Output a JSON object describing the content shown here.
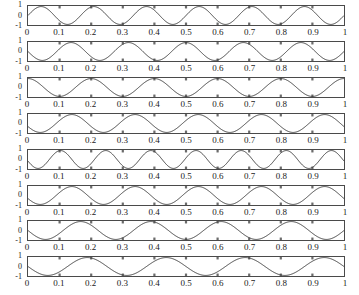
{
  "figure": {
    "background_color": "#ffffff",
    "axis_color": "#4a4a4a",
    "line_color": "#404040",
    "tick_color": "#6b6b6b",
    "width": 359,
    "height": 295,
    "subplot_count": 8
  },
  "axes": {
    "y_ticks": [
      "1",
      "0",
      "-1"
    ],
    "y_values": [
      1,
      0,
      -1
    ],
    "ylim": [
      -1,
      1
    ],
    "x_ticks": [
      "0",
      "0.1",
      "0.2",
      "0.3",
      "0.4",
      "0.5",
      "0.6",
      "0.7",
      "0.8",
      "0.9",
      "1"
    ],
    "x_values": [
      0,
      0.1,
      0.2,
      0.3,
      0.4,
      0.5,
      0.6,
      0.7,
      0.8,
      0.9,
      1
    ],
    "xlim": [
      0,
      1
    ]
  },
  "chart_data": {
    "type": "line",
    "title": "",
    "xlabel": "",
    "ylabel": "",
    "xlim": [
      0,
      1
    ],
    "ylim": [
      -1,
      1
    ],
    "grid": false,
    "legend": "none",
    "x_tick_labels": [
      "0",
      "0.1",
      "0.2",
      "0.3",
      "0.4",
      "0.5",
      "0.6",
      "0.7",
      "0.8",
      "0.9",
      "1"
    ],
    "y_tick_labels": [
      "1",
      "0",
      "-1"
    ],
    "panels": [
      {
        "index": 1,
        "label": "subplot-1",
        "form": "sine",
        "cycles": 6.0,
        "phase_deg": 0,
        "amplitude": 1
      },
      {
        "index": 2,
        "label": "subplot-2",
        "form": "sine",
        "cycles": 5.5,
        "phase_deg": 180,
        "amplitude": 1
      },
      {
        "index": 3,
        "label": "subplot-3",
        "form": "sine",
        "cycles": 5.0,
        "phase_deg": 90,
        "amplitude": 1
      },
      {
        "index": 4,
        "label": "subplot-4",
        "form": "sine",
        "cycles": 5.0,
        "phase_deg": 200,
        "amplitude": 1
      },
      {
        "index": 5,
        "label": "subplot-5",
        "form": "sine",
        "cycles": 7.0,
        "phase_deg": 190,
        "amplitude": 1
      },
      {
        "index": 6,
        "label": "subplot-6",
        "form": "sine",
        "cycles": 5.0,
        "phase_deg": 200,
        "amplitude": 1
      },
      {
        "index": 7,
        "label": "subplot-7",
        "form": "sine",
        "cycles": 4.5,
        "phase_deg": 180,
        "amplitude": 1
      },
      {
        "index": 8,
        "label": "subplot-8",
        "form": "sine",
        "cycles": 4.0,
        "phase_deg": 180,
        "amplitude": 1
      }
    ]
  }
}
